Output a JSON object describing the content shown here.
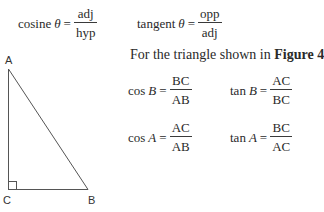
{
  "definitions": [
    {
      "func": "cosine",
      "var": "θ",
      "equals": "=",
      "num": "adj",
      "den": "hyp"
    },
    {
      "func": "tangent",
      "var": "θ",
      "equals": "=",
      "num": "opp",
      "den": "adj"
    }
  ],
  "caption": {
    "prefix": "For the triangle shown in ",
    "figure_ref": "Figure 4"
  },
  "ratios": [
    {
      "func": "cos",
      "angle": "B",
      "equals": "=",
      "num": "BC",
      "den": "AB"
    },
    {
      "func": "tan",
      "angle": "B",
      "equals": "=",
      "num": "AC",
      "den": "BC"
    },
    {
      "func": "cos",
      "angle": "A",
      "equals": "=",
      "num": "AC",
      "den": "AB"
    },
    {
      "func": "tan",
      "angle": "A",
      "equals": "=",
      "num": "BC",
      "den": "AC"
    }
  ],
  "triangle": {
    "vertices": {
      "A": "A",
      "B": "B",
      "C": "C"
    },
    "right_angle_at": "C",
    "stroke_color": "#555555"
  }
}
